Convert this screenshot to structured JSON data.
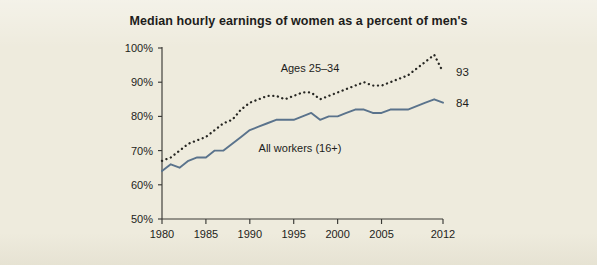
{
  "figure": {
    "background_color": "#eeebdd",
    "title": "Median hourly earnings of women as a percent of men's"
  },
  "chart_data": {
    "type": "line",
    "title": "Median hourly earnings of women as a percent of men's",
    "xlabel": "",
    "ylabel": "",
    "xlim": [
      1980,
      2012
    ],
    "ylim": [
      50,
      100
    ],
    "grid": false,
    "legend_position": "inline-annotation",
    "x_tick_labels": [
      "1980",
      "1985",
      "1990",
      "1995",
      "2000",
      "2005",
      "2012"
    ],
    "x_ticks": [
      1980,
      1985,
      1990,
      1995,
      2000,
      2005,
      2012
    ],
    "y_tick_labels": [
      "50%",
      "60%",
      "70%",
      "80%",
      "90%",
      "100%"
    ],
    "y_ticks": [
      50,
      60,
      70,
      80,
      90,
      100
    ],
    "x": [
      1980,
      1981,
      1982,
      1983,
      1984,
      1985,
      1986,
      1987,
      1988,
      1989,
      1990,
      1991,
      1992,
      1993,
      1994,
      1995,
      1996,
      1997,
      1998,
      1999,
      2000,
      2001,
      2002,
      2003,
      2004,
      2005,
      2006,
      2007,
      2008,
      2009,
      2010,
      2011,
      2012
    ],
    "series": [
      {
        "name": "Ages 25-34",
        "label": "Ages 25–34",
        "style": "dotted",
        "color": "#262622",
        "end_label": "93",
        "values": [
          67,
          68,
          70,
          72,
          73,
          74,
          76,
          78,
          79,
          82,
          84,
          85,
          86,
          86,
          85,
          86,
          87,
          87,
          85,
          86,
          87,
          88,
          89,
          90,
          89,
          89,
          90,
          91,
          92,
          94,
          96,
          98,
          93
        ]
      },
      {
        "name": "All workers (16+)",
        "label": "All workers (16+)",
        "style": "solid",
        "color": "#5a738c",
        "end_label": "84",
        "values": [
          64,
          66,
          65,
          67,
          68,
          68,
          70,
          70,
          72,
          74,
          76,
          77,
          78,
          79,
          79,
          79,
          80,
          81,
          79,
          80,
          80,
          81,
          82,
          82,
          81,
          81,
          82,
          82,
          82,
          83,
          84,
          85,
          84
        ]
      }
    ]
  },
  "annotations": {
    "series_label_top": "Ages 25–34",
    "series_label_bottom": "All workers (16+)",
    "end_label_top": "93",
    "end_label_bottom": "84"
  }
}
